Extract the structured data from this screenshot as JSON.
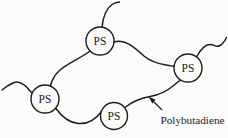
{
  "figure": {
    "nodes": [
      {
        "id": "top",
        "label": "PS"
      },
      {
        "id": "right",
        "label": "PS"
      },
      {
        "id": "left",
        "label": "PS"
      },
      {
        "id": "bottom",
        "label": "PS"
      }
    ],
    "annotation": {
      "label": "Polybutadiene"
    },
    "colors": {
      "line": "#1c1c1c",
      "background": "#fbfbfa",
      "node_fill": "#fbfbfa"
    }
  }
}
